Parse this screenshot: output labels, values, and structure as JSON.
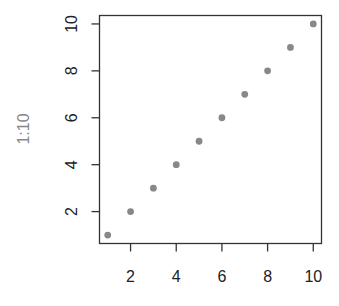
{
  "chart_data": {
    "type": "scatter",
    "title": "",
    "xlabel": "",
    "ylabel": "1:10",
    "x": [
      1,
      2,
      3,
      4,
      5,
      6,
      7,
      8,
      9,
      10
    ],
    "y": [
      1,
      2,
      3,
      4,
      5,
      6,
      7,
      8,
      9,
      10
    ],
    "xlim": [
      0.64,
      10.36
    ],
    "ylim": [
      0.64,
      10.36
    ],
    "x_ticks": [
      2,
      4,
      6,
      8,
      10
    ],
    "y_ticks": [
      2,
      4,
      6,
      8,
      10
    ],
    "grid": false,
    "legend": null,
    "point_color": "#888888",
    "axis_color": "#333333",
    "label_color": "#888888"
  }
}
